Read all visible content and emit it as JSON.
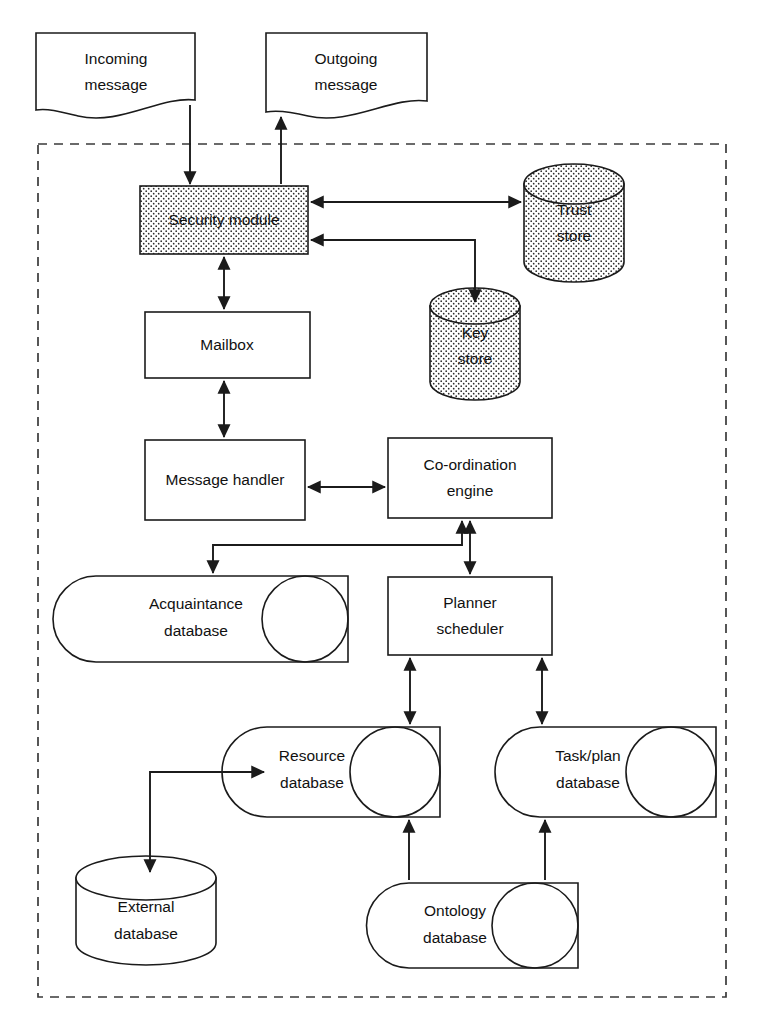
{
  "diagram": {
    "boundary": {
      "name": "agent-boundary",
      "style": "dashed"
    },
    "colors": {
      "stroke": "#1b1b1b",
      "boundary_stroke": "#3a3a3a",
      "fill": "#ffffff",
      "stipple_dot": "#2b2b2b"
    },
    "nodes": [
      {
        "id": "incoming_message",
        "label_line1": "Incoming",
        "label_line2": "message",
        "shape": "document"
      },
      {
        "id": "outgoing_message",
        "label_line1": "Outgoing",
        "label_line2": "message",
        "shape": "document"
      },
      {
        "id": "security_module",
        "label_line1": "Security module",
        "label_line2": "",
        "shape": "rect-stippled"
      },
      {
        "id": "trust_store",
        "label_line1": "Trust",
        "label_line2": "store",
        "shape": "cylinder-vertical-stippled"
      },
      {
        "id": "key_store",
        "label_line1": "Key",
        "label_line2": "store",
        "shape": "cylinder-vertical-stippled"
      },
      {
        "id": "mailbox",
        "label_line1": "Mailbox",
        "label_line2": "",
        "shape": "rect"
      },
      {
        "id": "message_handler",
        "label_line1": "Message handler",
        "label_line2": "",
        "shape": "rect"
      },
      {
        "id": "coordination_engine",
        "label_line1": "Co-ordination",
        "label_line2": "engine",
        "shape": "rect"
      },
      {
        "id": "acquaintance_database",
        "label_line1": "Acquaintance",
        "label_line2": "database",
        "shape": "cylinder-horizontal"
      },
      {
        "id": "planner_scheduler",
        "label_line1": "Planner",
        "label_line2": "scheduler",
        "shape": "rect"
      },
      {
        "id": "resource_database",
        "label_line1": "Resource",
        "label_line2": "database",
        "shape": "cylinder-horizontal"
      },
      {
        "id": "task_plan_database",
        "label_line1": "Task/plan",
        "label_line2": "database",
        "shape": "cylinder-horizontal"
      },
      {
        "id": "external_database",
        "label_line1": "External",
        "label_line2": "database",
        "shape": "cylinder-vertical"
      },
      {
        "id": "ontology_database",
        "label_line1": "Ontology",
        "label_line2": "database",
        "shape": "cylinder-horizontal"
      }
    ],
    "connectors": [
      {
        "id": "incoming-to-security",
        "from": "incoming_message",
        "to": "security_module",
        "direction": "one-way"
      },
      {
        "id": "security-to-outgoing",
        "from": "security_module",
        "to": "outgoing_message",
        "direction": "one-way"
      },
      {
        "id": "security-trust",
        "from": "security_module",
        "to": "trust_store",
        "direction": "two-way"
      },
      {
        "id": "security-key",
        "from": "security_module",
        "to": "key_store",
        "direction": "two-way"
      },
      {
        "id": "security-mailbox",
        "from": "security_module",
        "to": "mailbox",
        "direction": "two-way"
      },
      {
        "id": "mailbox-handler",
        "from": "mailbox",
        "to": "message_handler",
        "direction": "two-way"
      },
      {
        "id": "handler-coordination",
        "from": "message_handler",
        "to": "coordination_engine",
        "direction": "two-way"
      },
      {
        "id": "handler-acquaintance",
        "from": "message_handler",
        "to": "acquaintance_database",
        "direction": "one-way"
      },
      {
        "id": "coordination-acquaintance-link",
        "from": "coordination_engine",
        "to": "acquaintance_database",
        "direction": "one-way"
      },
      {
        "id": "coordination-planner",
        "from": "coordination_engine",
        "to": "planner_scheduler",
        "direction": "two-way"
      },
      {
        "id": "planner-resource",
        "from": "planner_scheduler",
        "to": "resource_database",
        "direction": "two-way"
      },
      {
        "id": "planner-taskplan",
        "from": "planner_scheduler",
        "to": "task_plan_database",
        "direction": "two-way"
      },
      {
        "id": "resource-external",
        "from": "resource_database",
        "to": "external_database",
        "direction": "two-way"
      },
      {
        "id": "ontology-resource",
        "from": "ontology_database",
        "to": "resource_database",
        "direction": "one-way"
      },
      {
        "id": "ontology-taskplan",
        "from": "ontology_database",
        "to": "task_plan_database",
        "direction": "one-way"
      }
    ]
  }
}
